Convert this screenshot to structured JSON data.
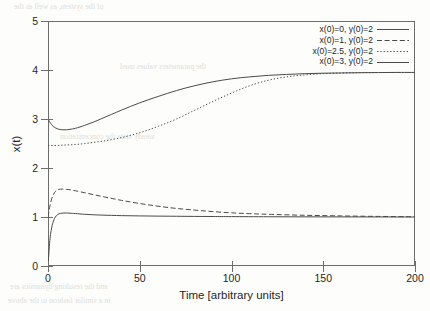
{
  "chart_data": {
    "type": "line",
    "title": "",
    "xlabel": "Time [arbitrary units]",
    "ylabel": "x(t)",
    "xlim": [
      0,
      200
    ],
    "ylim": [
      0,
      5
    ],
    "xticks": [
      0,
      50,
      100,
      150,
      200
    ],
    "yticks": [
      0,
      1,
      2,
      3,
      4,
      5
    ],
    "grid": false,
    "legend_position": "top-right",
    "line_color": "#4a4a4a",
    "series": [
      {
        "name": "x(0)=0, y(0)=2",
        "style": "solid",
        "x": [
          0,
          1,
          2,
          3,
          4,
          5,
          6,
          8,
          10,
          12,
          15,
          20,
          25,
          30,
          40,
          50,
          60,
          70,
          80,
          90,
          100,
          120,
          140,
          160,
          180,
          200
        ],
        "y": [
          0.0,
          0.52,
          0.78,
          0.92,
          1.0,
          1.04,
          1.065,
          1.08,
          1.082,
          1.078,
          1.07,
          1.055,
          1.045,
          1.038,
          1.028,
          1.022,
          1.018,
          1.015,
          1.012,
          1.01,
          1.008,
          1.005,
          1.003,
          1.002,
          1.001,
          1.0
        ]
      },
      {
        "name": "x(0)=1, y(0)=2",
        "style": "dashed",
        "x": [
          0,
          1,
          2,
          3,
          4,
          5,
          6,
          8,
          10,
          12,
          15,
          20,
          25,
          30,
          40,
          50,
          60,
          70,
          80,
          90,
          100,
          110,
          120,
          140,
          160,
          180,
          200
        ],
        "y": [
          1.0,
          1.22,
          1.37,
          1.46,
          1.52,
          1.55,
          1.565,
          1.57,
          1.565,
          1.555,
          1.535,
          1.495,
          1.455,
          1.415,
          1.34,
          1.275,
          1.22,
          1.175,
          1.14,
          1.11,
          1.085,
          1.068,
          1.055,
          1.035,
          1.022,
          1.012,
          1.005
        ]
      },
      {
        "name": "x(0)=2.5, y(0)=2",
        "style": "dotted",
        "x": [
          0,
          5,
          10,
          15,
          20,
          30,
          40,
          50,
          60,
          70,
          80,
          90,
          100,
          110,
          120,
          130,
          140,
          150,
          160,
          170,
          180,
          190,
          200
        ],
        "y": [
          2.46,
          2.46,
          2.47,
          2.48,
          2.5,
          2.55,
          2.62,
          2.72,
          2.85,
          3.0,
          3.18,
          3.36,
          3.53,
          3.68,
          3.79,
          3.86,
          3.9,
          3.925,
          3.938,
          3.945,
          3.948,
          3.95,
          3.95
        ]
      },
      {
        "name": "x(0)=3, y(0)=2",
        "style": "solid",
        "x": [
          0,
          2,
          4,
          6,
          8,
          10,
          12,
          15,
          20,
          25,
          30,
          40,
          50,
          60,
          70,
          80,
          90,
          100,
          110,
          120,
          130,
          140,
          150,
          160,
          170,
          180,
          190,
          200
        ],
        "y": [
          3.0,
          2.88,
          2.82,
          2.79,
          2.78,
          2.78,
          2.79,
          2.81,
          2.87,
          2.94,
          3.02,
          3.18,
          3.33,
          3.46,
          3.58,
          3.68,
          3.76,
          3.82,
          3.86,
          3.89,
          3.91,
          3.925,
          3.935,
          3.94,
          3.945,
          3.948,
          3.95,
          3.95
        ]
      }
    ]
  },
  "bleed_text": [
    "of the system, as well as the",
    "the parameters values used",
    "steady state the concentration",
    "and the resulting dynamics are",
    "in a similar fashion to the above"
  ]
}
